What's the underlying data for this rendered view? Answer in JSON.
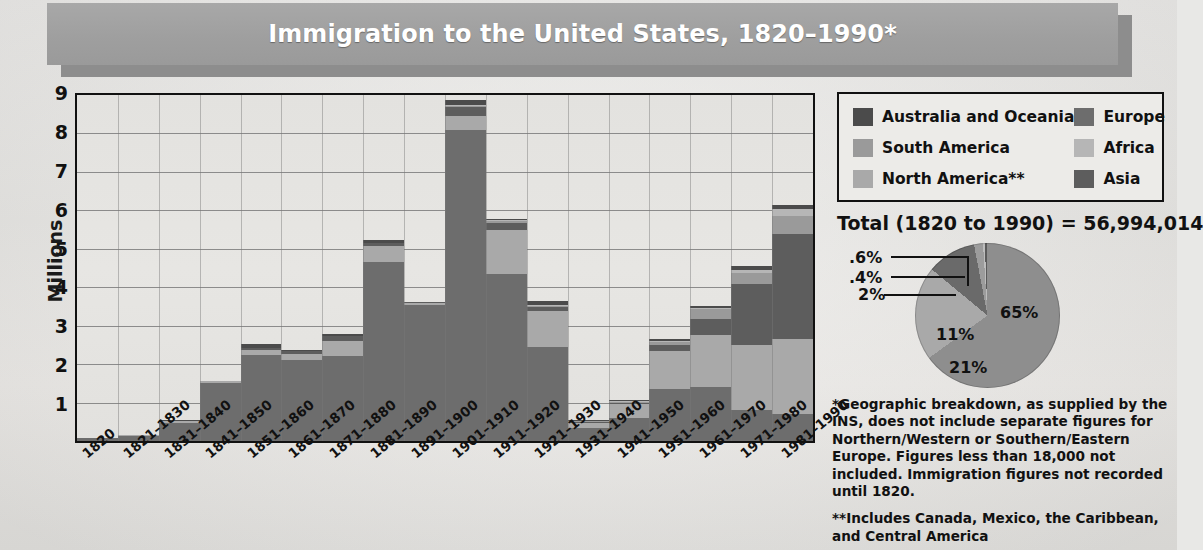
{
  "title": "Immigration to the United States, 1820–1990*",
  "axis": {
    "ylabel": "Millions",
    "yticks": [
      "9",
      "8",
      "7",
      "6",
      "5",
      "4",
      "3",
      "2",
      "1"
    ]
  },
  "legend": {
    "items": [
      {
        "label": "Australia and Oceania",
        "color": "#4b4b4b",
        "key": "australia_oceania"
      },
      {
        "label": "Europe",
        "color": "#6d6d6d",
        "key": "europe"
      },
      {
        "label": "South America",
        "color": "#9a9a9a",
        "key": "south_america"
      },
      {
        "label": "Africa",
        "color": "#b6b6b6",
        "key": "africa"
      },
      {
        "label": "North America**",
        "color": "#a9a9a9",
        "key": "north_america"
      },
      {
        "label": "Asia",
        "color": "#5d5d5d",
        "key": "asia"
      }
    ]
  },
  "total": {
    "prefix": "Total (1820 to 1990) = ",
    "value": "56,994,014"
  },
  "notes": [
    "*Geographic breakdown, as supplied by the INS, does not include separate figures for Northern/Western or Southern/Eastern Europe. Figures less than 18,000 not included. Immigration figures not recorded until 1820.",
    "**Includes Canada, Mexico, the Caribbean, and Central America"
  ],
  "chart_data": [
    {
      "type": "bar",
      "title": "Immigration to the United States, 1820–1990*",
      "stacked": true,
      "xlabel": "",
      "ylabel": "Millions",
      "ylim": [
        0,
        9
      ],
      "grid": true,
      "legend_position": "top-right",
      "categories": [
        "1820",
        "1821–1830",
        "1831–1840",
        "1841–1850",
        "1851–1860",
        "1861–1870",
        "1871–1880",
        "1881–1890",
        "1891–1900",
        "1901–1910",
        "1911–1920",
        "1921–1930",
        "1931–1940",
        "1941–1950",
        "1951–1960",
        "1961–1970",
        "1971–1980",
        "1981–1990"
      ],
      "series": [
        {
          "name": "Europe",
          "color": "#6d6d6d",
          "values": [
            0.08,
            0.12,
            0.48,
            1.5,
            2.25,
            2.1,
            2.2,
            4.65,
            3.55,
            8.1,
            4.35,
            2.45,
            0.35,
            0.6,
            1.35,
            1.4,
            0.8,
            0.7
          ]
        },
        {
          "name": "North America**",
          "color": "#a9a9a9",
          "values": [
            0.0,
            0.01,
            0.04,
            0.06,
            0.12,
            0.17,
            0.4,
            0.42,
            0.04,
            0.36,
            1.14,
            0.92,
            0.11,
            0.35,
            1.0,
            1.35,
            1.7,
            1.95
          ]
        },
        {
          "name": "Asia",
          "color": "#5d5d5d",
          "values": [
            0.0,
            0.0,
            0.0,
            0.0,
            0.04,
            0.06,
            0.12,
            0.07,
            0.03,
            0.24,
            0.19,
            0.11,
            0.02,
            0.04,
            0.15,
            0.43,
            1.59,
            2.74
          ]
        },
        {
          "name": "South America",
          "color": "#9a9a9a",
          "values": [
            0.0,
            0.0,
            0.0,
            0.0,
            0.0,
            0.0,
            0.0,
            0.0,
            0.0,
            0.01,
            0.04,
            0.04,
            0.01,
            0.02,
            0.08,
            0.26,
            0.29,
            0.46
          ]
        },
        {
          "name": "Africa",
          "color": "#b6b6b6",
          "values": [
            0.0,
            0.0,
            0.0,
            0.0,
            0.0,
            0.0,
            0.0,
            0.0,
            0.0,
            0.01,
            0.01,
            0.01,
            0.0,
            0.01,
            0.02,
            0.03,
            0.08,
            0.18
          ]
        },
        {
          "name": "Australia and Oceania",
          "color": "#4b4b4b",
          "values": [
            0.0,
            0.0,
            0.02,
            0.0,
            0.12,
            0.02,
            0.06,
            0.1,
            0.0,
            0.12,
            0.04,
            0.1,
            0.01,
            0.03,
            0.04,
            0.04,
            0.1,
            0.1
          ]
        }
      ],
      "totals": [
        0.08,
        0.13,
        0.54,
        1.56,
        2.53,
        2.35,
        2.78,
        5.24,
        3.62,
        8.84,
        5.77,
        3.63,
        0.5,
        1.05,
        2.64,
        3.51,
        4.56,
        6.13
      ]
    },
    {
      "type": "pie",
      "title": "Total (1820 to 1990) = 56,994,014",
      "labels": [
        "Europe",
        "North America**",
        "Asia",
        "South America",
        "Africa",
        "Australia and Oceania"
      ],
      "values": [
        65,
        21,
        11,
        2,
        0.4,
        0.6
      ],
      "value_labels": [
        "65%",
        "21%",
        "11%",
        "2%",
        ".4%",
        ".6%"
      ],
      "colors": [
        "#8e8e8e",
        "#a9a9a9",
        "#6a6a6a",
        "#9c9c9c",
        "#bdbdbd",
        "#5a5a5a"
      ]
    }
  ],
  "colors": {
    "title_bar": "#9f9f9f",
    "title_shadow": "#8d8d8d",
    "title_text": "#ffffff",
    "plot_bg": "#e4e3e0",
    "page_bg": "#e8e8e6",
    "axis": "#111111"
  }
}
